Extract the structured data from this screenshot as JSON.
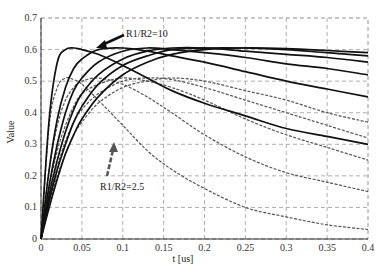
{
  "chart_data": {
    "type": "line",
    "title": "",
    "xlabel": "t [us]",
    "ylabel": "Value",
    "xlim": [
      0,
      0.4
    ],
    "ylim": [
      0,
      0.7
    ],
    "xticks": [
      "0",
      "0.05",
      "0.1",
      "0.15",
      "0.2",
      "0.25",
      "0.3",
      "0.35",
      "0.4"
    ],
    "yticks": [
      "0",
      "0.1",
      "0.2",
      "0.3",
      "0.4",
      "0.5",
      "0.6",
      "0.7"
    ],
    "grid": true,
    "legend": null,
    "annotations": [
      {
        "text": "R1/R2=10",
        "arrow_to": [
          0.07,
          0.61
        ]
      },
      {
        "text": "R1/R2=2.5",
        "arrow_to": [
          0.09,
          0.33
        ]
      }
    ],
    "x": [
      0,
      0.01,
      0.02,
      0.03,
      0.04,
      0.05,
      0.07,
      0.1,
      0.13,
      0.16,
      0.2,
      0.25,
      0.3,
      0.35,
      0.4
    ],
    "series": [
      {
        "name": "R1/R2=10 (a)",
        "style": "solid",
        "values": [
          0,
          0.38,
          0.56,
          0.6,
          0.605,
          0.6,
          0.585,
          0.55,
          0.51,
          0.47,
          0.43,
          0.39,
          0.35,
          0.325,
          0.3
        ]
      },
      {
        "name": "R1/R2=10 (b)",
        "style": "solid",
        "values": [
          0,
          0.22,
          0.38,
          0.48,
          0.54,
          0.57,
          0.6,
          0.605,
          0.595,
          0.58,
          0.56,
          0.53,
          0.5,
          0.475,
          0.45
        ]
      },
      {
        "name": "R1/R2=10 (c)",
        "style": "solid",
        "values": [
          0,
          0.17,
          0.3,
          0.4,
          0.47,
          0.51,
          0.56,
          0.595,
          0.605,
          0.6,
          0.59,
          0.575,
          0.555,
          0.54,
          0.52
        ]
      },
      {
        "name": "R1/R2=10 (d)",
        "style": "solid",
        "values": [
          0,
          0.14,
          0.25,
          0.34,
          0.41,
          0.46,
          0.52,
          0.57,
          0.595,
          0.605,
          0.605,
          0.595,
          0.585,
          0.575,
          0.56
        ]
      },
      {
        "name": "R1/R2=10 (e)",
        "style": "solid",
        "values": [
          0,
          0.12,
          0.22,
          0.3,
          0.37,
          0.42,
          0.49,
          0.55,
          0.58,
          0.6,
          0.605,
          0.605,
          0.6,
          0.59,
          0.58
        ]
      },
      {
        "name": "R1/R2=10 (f)",
        "style": "solid",
        "values": [
          0,
          0.1,
          0.19,
          0.27,
          0.33,
          0.38,
          0.45,
          0.52,
          0.56,
          0.585,
          0.6,
          0.605,
          0.603,
          0.597,
          0.59
        ]
      },
      {
        "name": "R1/R2=2.5 (a)",
        "style": "dashed",
        "values": [
          0,
          0.36,
          0.48,
          0.51,
          0.505,
          0.49,
          0.44,
          0.36,
          0.28,
          0.22,
          0.16,
          0.1,
          0.07,
          0.045,
          0.03
        ]
      },
      {
        "name": "R1/R2=2.5 (b)",
        "style": "dashed",
        "values": [
          0,
          0.22,
          0.36,
          0.44,
          0.48,
          0.5,
          0.51,
          0.49,
          0.45,
          0.4,
          0.33,
          0.26,
          0.21,
          0.18,
          0.15
        ]
      },
      {
        "name": "R1/R2=2.5 (c)",
        "style": "dashed",
        "values": [
          0,
          0.16,
          0.28,
          0.36,
          0.42,
          0.46,
          0.49,
          0.51,
          0.5,
          0.48,
          0.44,
          0.38,
          0.33,
          0.29,
          0.25
        ]
      },
      {
        "name": "R1/R2=2.5 (d)",
        "style": "dashed",
        "values": [
          0,
          0.13,
          0.23,
          0.31,
          0.37,
          0.41,
          0.46,
          0.5,
          0.51,
          0.505,
          0.48,
          0.44,
          0.4,
          0.36,
          0.32
        ]
      },
      {
        "name": "R1/R2=2.5 (e)",
        "style": "dashed",
        "values": [
          0,
          0.11,
          0.2,
          0.27,
          0.33,
          0.37,
          0.43,
          0.48,
          0.5,
          0.51,
          0.5,
          0.47,
          0.44,
          0.4,
          0.37
        ]
      }
    ]
  }
}
